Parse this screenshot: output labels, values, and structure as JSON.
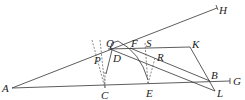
{
  "diagram": {
    "labels": {
      "A": "A",
      "H": "H",
      "Q": "Q",
      "F": "F",
      "S": "S",
      "K": "K",
      "P": "P",
      "D": "D",
      "R": "R",
      "B": "B",
      "G": "G",
      "C": "C",
      "E": "E",
      "L": "L"
    },
    "colors": {
      "line": "#333333",
      "text": "#222222"
    }
  }
}
